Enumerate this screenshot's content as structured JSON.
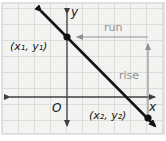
{
  "figure": {
    "labels": {
      "y_axis": "y",
      "x_axis": "x",
      "origin": "O",
      "run": "run",
      "rise": "rise",
      "point1": "(x₁, y₁)",
      "point2": "(x₂, y₂)"
    },
    "colors": {
      "grid_background": "#f3f4f1",
      "grid_line": "#d9dcd9",
      "grid_border": "#c6cac6",
      "axis": "#3f3f3f",
      "main_line": "#141414",
      "guide": "#8f9191",
      "point": "#111111",
      "text": "#1a1a1a"
    }
  }
}
